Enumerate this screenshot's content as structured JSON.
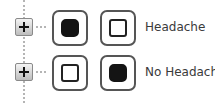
{
  "rows": [
    {
      "label": "Headache",
      "option1_state": "filled",
      "option2_state": "empty"
    },
    {
      "label": "No Headache",
      "option1_state": "empty",
      "option2_state": "filled"
    }
  ],
  "icons": {
    "expand": "plus-box-icon",
    "connector": "dotted-line",
    "selected": "filled-square",
    "unselected": "hollow-square"
  },
  "colors": {
    "line": "#b5b5b5",
    "fill": "#141414",
    "text": "#3a3a3a"
  }
}
